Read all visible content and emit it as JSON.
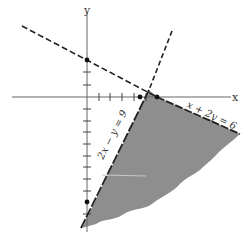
{
  "diagram": {
    "axes": {
      "x_label": "x",
      "y_label": "y",
      "origin_px": [
        87,
        97
      ],
      "unit_px": 11.7
    },
    "lines": [
      {
        "id": "line-x-plus-2y",
        "equation": "x + 2y = 6",
        "style": "dashed"
      },
      {
        "id": "line-2x-minus-y",
        "equation": "2x − y = 9",
        "style": "dashed"
      }
    ],
    "points": [
      {
        "label": "(0, 3)",
        "x": 0,
        "y": 3
      },
      {
        "label": "(4.5, 0)",
        "x": 4.5,
        "y": 0
      },
      {
        "label": "(6, 0)",
        "x": 6,
        "y": 0
      },
      {
        "label": "(0, -9)",
        "x": 0,
        "y": -9
      }
    ],
    "shaded_region": "x + 2y ≥ 6 and 2x − y ≤ 9 (below/right of both lines)",
    "colors": {
      "shade": "#8e8e8e",
      "axis": "#555555",
      "line": "#222222"
    }
  }
}
